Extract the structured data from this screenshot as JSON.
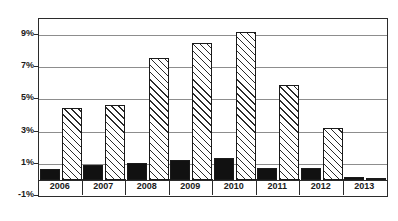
{
  "chart_data": {
    "type": "bar",
    "title": "",
    "xlabel": "",
    "ylabel": "",
    "categories": [
      "2006",
      "2007",
      "2008",
      "2009",
      "2010",
      "2011",
      "2012",
      "2013"
    ],
    "ylim": [
      -1,
      10
    ],
    "ytick_labels": [
      "9%",
      "7%",
      "5%",
      "3%",
      "1%",
      "-1%"
    ],
    "ytick_values": [
      9,
      7,
      5,
      3,
      1,
      -1
    ],
    "grid": true,
    "legend": "none",
    "series": [
      {
        "name": "solid-black-series",
        "style": "solid",
        "color": "#111111",
        "values": [
          0.7,
          0.9,
          1.05,
          1.25,
          1.35,
          0.75,
          0.75,
          0.2
        ]
      },
      {
        "name": "hatched-series",
        "style": "diagonal-hatch",
        "color": "#2b2b2b",
        "values": [
          4.45,
          4.65,
          7.55,
          8.5,
          9.2,
          5.9,
          3.2,
          0.1
        ]
      }
    ]
  }
}
